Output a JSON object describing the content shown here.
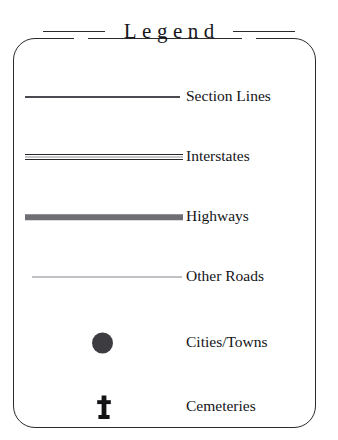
{
  "legend": {
    "title": "Legend",
    "entries": [
      {
        "label": "Section Lines",
        "symbol": "thin-line",
        "symbol_color": "#4a4a50"
      },
      {
        "label": "Interstates",
        "symbol": "double-line",
        "symbol_color": "#27272b"
      },
      {
        "label": "Highways",
        "symbol": "thick-band",
        "symbol_color": "#6e6e74"
      },
      {
        "label": "Other Roads",
        "symbol": "hairline",
        "symbol_color": "#83838b"
      },
      {
        "label": "Cities/Towns",
        "symbol": "filled-circle",
        "symbol_color": "#3c3c41"
      },
      {
        "label": "Cemeteries",
        "symbol": "cross",
        "symbol_color": "#141417"
      }
    ],
    "colors": {
      "background": "#ffffff",
      "border": "#2a2a2e",
      "text": "#141417"
    }
  }
}
